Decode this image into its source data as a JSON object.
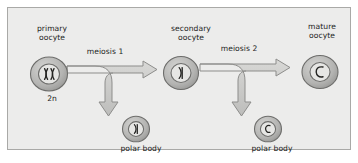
{
  "figure": {
    "panel_background": "#ececeb",
    "panel_border": "#a9a9a7",
    "text_color": "#1d1d1b",
    "cell_fill": "#b8b8b6",
    "cell_stroke": "#6f6f6d",
    "nucleus_fill": "#e3e3e1",
    "chromosome_color": "#2b2b29",
    "arrow_fill": "#c9c9c7",
    "arrow_stroke": "#8a8a88"
  },
  "labels": {
    "primary_oocyte": "primary\noocyte",
    "secondary_oocyte": "secondary\noocyte",
    "mature_oocyte": "mature\noocyte",
    "ploidy_2n": "2n",
    "polar_body_1": "polar body",
    "polar_body_2": "polar body",
    "meiosis_1": "meiosis 1",
    "meiosis_2": "meiosis 2"
  },
  "cells": [
    {
      "id": "primary-oocyte",
      "label": "primary oocyte",
      "ploidy": "2n",
      "chromosome_count": 2,
      "chromosome_form": "paired-homologous",
      "diameter_px": 36
    },
    {
      "id": "secondary-oocyte",
      "label": "secondary oocyte",
      "chromosome_count": 1,
      "chromosome_form": "single-replicated",
      "diameter_px": 32
    },
    {
      "id": "mature-oocyte",
      "label": "mature oocyte",
      "chromosome_count": 1,
      "chromosome_form": "single-chromatid",
      "diameter_px": 34
    },
    {
      "id": "polar-body-1",
      "label": "polar body",
      "chromosome_count": 1,
      "chromosome_form": "single-replicated",
      "diameter_px": 26
    },
    {
      "id": "polar-body-2",
      "label": "polar body",
      "chromosome_count": 1,
      "chromosome_form": "single-chromatid",
      "diameter_px": 26
    }
  ],
  "arrows": [
    {
      "id": "meiosis-1",
      "label": "meiosis 1",
      "from": "primary-oocyte",
      "to": [
        "secondary-oocyte",
        "polar-body-1"
      ],
      "shape": "branching-right-and-down"
    },
    {
      "id": "meiosis-2",
      "label": "meiosis 2",
      "from": "secondary-oocyte",
      "to": [
        "mature-oocyte",
        "polar-body-2"
      ],
      "shape": "branching-right-and-down"
    }
  ]
}
